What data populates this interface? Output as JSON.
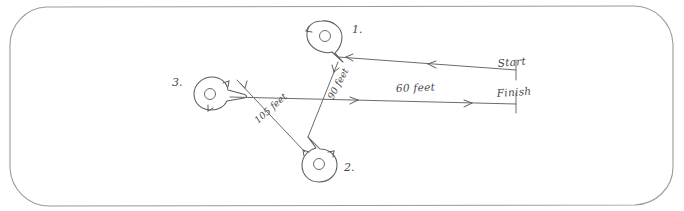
{
  "diagram": {
    "background_color": "#ffffff",
    "ink_color": "#5c5c5c",
    "border_color": "#9a9a9a",
    "border_shape": "rounded-rectangle"
  },
  "points": [
    {
      "id": "point-1",
      "label": "1.",
      "label_x": 352,
      "label_y": 33,
      "cx": 326,
      "cy": 36,
      "r": 15.5,
      "inner_r": 5.5,
      "tail_direction": "down-right"
    },
    {
      "id": "point-3",
      "label": "3.",
      "label_x": 172,
      "label_y": 86,
      "cx": 211,
      "cy": 93,
      "r": 15.5,
      "inner_r": 5.5,
      "tail_direction": "right"
    },
    {
      "id": "point-2",
      "label": "2.",
      "label_x": 344,
      "label_y": 171,
      "cx": 320,
      "cy": 164,
      "r": 15.5,
      "inner_r": 5.5,
      "tail_direction": "up-right"
    }
  ],
  "measurements": [
    {
      "id": "measure-60",
      "label": "60 feet",
      "x": 420,
      "y": 93,
      "rotation": 2,
      "segment": "point-3-tail to finish line"
    },
    {
      "id": "measure-90",
      "label": "90 feet",
      "x": 333,
      "y": 97,
      "rotation": -62,
      "segment": "point-2 to point-1"
    },
    {
      "id": "measure-105",
      "label": "105 feet",
      "x": 260,
      "y": 122,
      "rotation": -38,
      "segment": "point-2 to point-3"
    }
  ],
  "endpoints": [
    {
      "id": "start-marker",
      "label": "Start",
      "x": 498,
      "y": 67,
      "tick_x": 516,
      "tick_y_top": 60,
      "tick_y_bottom": 80
    },
    {
      "id": "finish-marker",
      "label": "Finish",
      "x": 497,
      "y": 97,
      "tick_x": 516,
      "tick_y_top": 91,
      "tick_y_bottom": 111
    }
  ],
  "lines": {
    "start_line_label": "Start",
    "finish_line_label": "Finish",
    "start_direction": "leftward",
    "finish_direction": "rightward"
  }
}
